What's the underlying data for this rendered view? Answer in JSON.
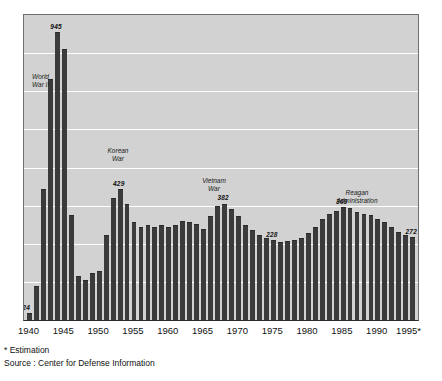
{
  "chart_data": {
    "type": "bar",
    "title": "",
    "xlabel": "",
    "ylabel": "",
    "ylim": [
      0,
      1000
    ],
    "grid": true,
    "legend": "none",
    "gridline_count": 7,
    "bar_color": "#3b3b3b",
    "plot_background": "#d2d2d2",
    "gridline_color": "#ffffff",
    "categories": [
      "1940",
      "1941",
      "1942",
      "1943",
      "1944",
      "1945",
      "1946",
      "1947",
      "1948",
      "1949",
      "1950",
      "1951",
      "1952",
      "1953",
      "1954",
      "1955",
      "1956",
      "1957",
      "1958",
      "1959",
      "1960",
      "1961",
      "1962",
      "1963",
      "1964",
      "1965",
      "1966",
      "1967",
      "1968",
      "1969",
      "1970",
      "1971",
      "1972",
      "1973",
      "1974",
      "1975",
      "1976",
      "1977",
      "1978",
      "1979",
      "1980",
      "1981",
      "1982",
      "1983",
      "1984",
      "1985",
      "1986",
      "1987",
      "1988",
      "1989",
      "1990",
      "1991",
      "1992",
      "1993",
      "1994",
      "1995"
    ],
    "values": [
      24,
      110,
      430,
      790,
      945,
      890,
      345,
      145,
      130,
      155,
      160,
      280,
      400,
      429,
      380,
      320,
      305,
      310,
      305,
      310,
      305,
      310,
      325,
      320,
      315,
      300,
      340,
      375,
      382,
      365,
      340,
      310,
      295,
      280,
      270,
      262,
      255,
      258,
      262,
      270,
      285,
      305,
      330,
      348,
      358,
      369,
      368,
      355,
      348,
      345,
      330,
      320,
      305,
      288,
      280,
      272
    ],
    "x_tick_labels": [
      "1940",
      "1945",
      "1950",
      "1955",
      "1960",
      "1965",
      "1970",
      "1975",
      "1980",
      "1985",
      "1990",
      "1995*"
    ],
    "data_labels": [
      {
        "category": "1940",
        "value": 24,
        "text": "24"
      },
      {
        "category": "1944",
        "value": 945,
        "text": "945"
      },
      {
        "category": "1953",
        "value": 429,
        "text": "429"
      },
      {
        "category": "1968",
        "value": 382,
        "text": "382"
      },
      {
        "category": "1975",
        "value": 262,
        "text": "228"
      },
      {
        "category": "1985",
        "value": 369,
        "text": "369"
      },
      {
        "category": "1995",
        "value": 272,
        "text": "272"
      }
    ],
    "annotations": [
      {
        "name": "world-war-ii",
        "line1": "World",
        "line2": "War II"
      },
      {
        "name": "korean-war",
        "line1": "Korean",
        "line2": "War"
      },
      {
        "name": "vietnam-war",
        "line1": "Vietnam",
        "line2": "War"
      },
      {
        "name": "reagan-administration",
        "line1": "Reagan",
        "line2": "Administration"
      }
    ]
  },
  "footnotes": {
    "estimation": "* Estimation",
    "source": "Source : Center for Defense Information"
  }
}
